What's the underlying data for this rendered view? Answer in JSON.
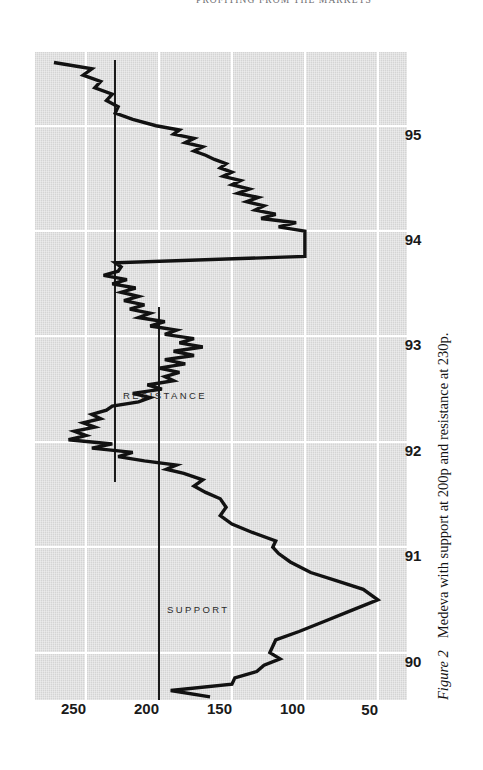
{
  "page": {
    "running_head": "PROFITING FROM THE MARKETS"
  },
  "caption": {
    "label": "Figure 2",
    "text": "Medeva with support at 200p and resistance at 230p."
  },
  "annotations": {
    "support_label": "SUPPORT",
    "resistance_label": "RESISTANCE"
  },
  "colors": {
    "plot_background": "#d4d4d4",
    "gridline": "#ffffff",
    "series_line": "#121212",
    "level_line": "#1b1b1b",
    "text": "#1a1a1a"
  },
  "chart_data": {
    "type": "line",
    "title": "",
    "subtitle": "",
    "xlabel": "",
    "ylabel": "",
    "grid": true,
    "legend": "none",
    "xlim": [
      89.55,
      95.7
    ],
    "ylim": [
      30,
      285
    ],
    "x_tick_labels": [
      "90",
      "91",
      "92",
      "93",
      "94",
      "95"
    ],
    "x_tick_values": [
      90,
      91,
      92,
      93,
      94,
      95
    ],
    "y_tick_labels": [
      "50",
      "100",
      "150",
      "200",
      "250"
    ],
    "y_tick_values": [
      50,
      100,
      150,
      200,
      250
    ],
    "series": [
      {
        "name": "Medeva share price (p)",
        "x": [
          89.58,
          89.64,
          89.7,
          89.76,
          89.82,
          89.88,
          89.94,
          90.0,
          90.06,
          90.12,
          90.2,
          90.3,
          90.4,
          90.5,
          90.6,
          90.68,
          90.76,
          90.86,
          90.94,
          91.0,
          91.06,
          91.14,
          91.22,
          91.3,
          91.38,
          91.46,
          91.52,
          91.58,
          91.64,
          91.7,
          91.74,
          91.78,
          91.82,
          91.86,
          91.9,
          91.94,
          91.98,
          92.02,
          92.06,
          92.1,
          92.14,
          92.18,
          92.22,
          92.26,
          92.3,
          92.34,
          92.38,
          92.42,
          92.46,
          92.5,
          92.54,
          92.58,
          92.62,
          92.66,
          92.7,
          92.74,
          92.78,
          92.82,
          92.86,
          92.9,
          92.94,
          92.98,
          93.02,
          93.06,
          93.1,
          93.14,
          93.18,
          93.22,
          93.26,
          93.3,
          93.34,
          93.38,
          93.42,
          93.46,
          93.5,
          93.54,
          93.58,
          93.62,
          93.66,
          93.7,
          93.76,
          93.82,
          93.88,
          93.94,
          94.0,
          94.04,
          94.08,
          94.12,
          94.16,
          94.2,
          94.24,
          94.28,
          94.32,
          94.36,
          94.4,
          94.44,
          94.48,
          94.52,
          94.56,
          94.6,
          94.64,
          94.68,
          94.72,
          94.76,
          94.8,
          94.84,
          94.88,
          94.92,
          94.96,
          95.0,
          95.06,
          95.12,
          95.18,
          95.24,
          95.3,
          95.36,
          95.42,
          95.48,
          95.54,
          95.6
        ],
        "y": [
          165,
          192,
          150,
          148,
          133,
          128,
          117,
          124,
          122,
          120,
          104,
          86,
          68,
          50,
          60,
          78,
          96,
          110,
          118,
          122,
          120,
          136,
          150,
          158,
          154,
          158,
          168,
          176,
          170,
          183,
          195,
          188,
          210,
          228,
          218,
          246,
          232,
          262,
          250,
          258,
          244,
          252,
          240,
          246,
          236,
          232,
          214,
          206,
          218,
          198,
          208,
          190,
          196,
          186,
          200,
          182,
          196,
          176,
          190,
          170,
          186,
          176,
          196,
          188,
          206,
          196,
          214,
          206,
          220,
          210,
          224,
          214,
          226,
          216,
          232,
          222,
          238,
          228,
          226,
          230,
          100,
          100,
          100,
          100,
          100,
          118,
          106,
          130,
          120,
          134,
          128,
          140,
          132,
          146,
          138,
          150,
          144,
          156,
          150,
          158,
          154,
          162,
          168,
          176,
          170,
          182,
          176,
          190,
          186,
          202,
          218,
          230,
          228,
          236,
          232,
          244,
          240,
          252,
          246,
          272
        ]
      }
    ],
    "reference_lines": [
      {
        "name": "support",
        "label": "SUPPORT",
        "value": 200,
        "x_start": 89.55,
        "x_end": 93.28
      },
      {
        "name": "resistance",
        "label": "RESISTANCE",
        "value": 230,
        "x_start": 91.62,
        "x_end": 95.62
      }
    ]
  }
}
